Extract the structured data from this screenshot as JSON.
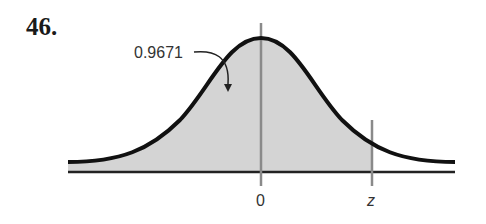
{
  "problem": {
    "number": "46."
  },
  "diagram": {
    "type": "normal-distribution-curve",
    "shaded_region": "left of z",
    "area_label": "0.9671",
    "axis_labels": {
      "center": "0",
      "boundary": "z"
    },
    "colors": {
      "curve": "#111111",
      "shade": "#d4d4d4",
      "axis": "#222222",
      "markers": "#8a8a8a"
    }
  }
}
